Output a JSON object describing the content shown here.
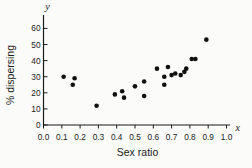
{
  "figure": {
    "background_color": "#fbfbf9",
    "ink_color": "#1a1a1a"
  },
  "chart_data": {
    "type": "scatter",
    "title": "",
    "xlabel": "Sex ratio",
    "ylabel": "% dispersing",
    "x_axis_symbol": "x",
    "y_axis_symbol": "y",
    "xlim": [
      0.0,
      1.0
    ],
    "ylim": [
      0,
      60
    ],
    "x_ticks": [
      "0.0",
      "0.1",
      "0.2",
      "0.3",
      "0.4",
      "0.5",
      "0.6",
      "0.7",
      "0.8",
      "0.9",
      "1.0"
    ],
    "y_ticks": [
      "0",
      "10",
      "20",
      "30",
      "40",
      "50",
      "60"
    ],
    "grid": false,
    "legend": null,
    "marker": {
      "shape": "circle",
      "color": "#111111",
      "radius_px": 2.3
    },
    "points": [
      {
        "x": 0.11,
        "y": 30
      },
      {
        "x": 0.16,
        "y": 25
      },
      {
        "x": 0.17,
        "y": 29
      },
      {
        "x": 0.29,
        "y": 12
      },
      {
        "x": 0.39,
        "y": 19
      },
      {
        "x": 0.43,
        "y": 21
      },
      {
        "x": 0.44,
        "y": 17
      },
      {
        "x": 0.5,
        "y": 24
      },
      {
        "x": 0.55,
        "y": 27
      },
      {
        "x": 0.55,
        "y": 18
      },
      {
        "x": 0.62,
        "y": 35
      },
      {
        "x": 0.66,
        "y": 30
      },
      {
        "x": 0.66,
        "y": 25
      },
      {
        "x": 0.68,
        "y": 36
      },
      {
        "x": 0.7,
        "y": 31
      },
      {
        "x": 0.72,
        "y": 32
      },
      {
        "x": 0.75,
        "y": 31
      },
      {
        "x": 0.77,
        "y": 33
      },
      {
        "x": 0.78,
        "y": 35
      },
      {
        "x": 0.81,
        "y": 41
      },
      {
        "x": 0.83,
        "y": 41
      },
      {
        "x": 0.89,
        "y": 53
      }
    ]
  }
}
